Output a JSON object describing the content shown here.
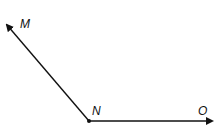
{
  "diagram": {
    "type": "angle",
    "vertex": {
      "label": "N",
      "x": 89,
      "y": 121
    },
    "rays": [
      {
        "label": "M",
        "end": {
          "x": 6,
          "y": 24
        }
      },
      {
        "label": "O",
        "end": {
          "x": 213,
          "y": 121
        }
      }
    ],
    "line_color": "#111111"
  }
}
